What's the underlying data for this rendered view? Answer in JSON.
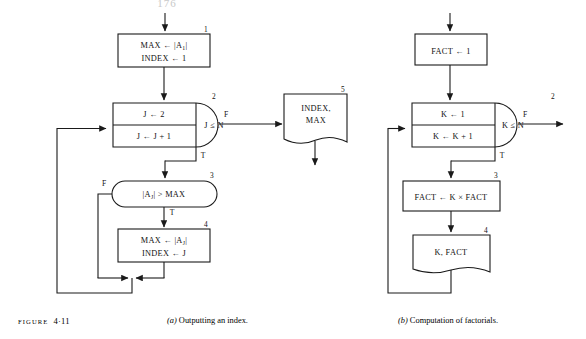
{
  "page": {
    "page_number": "176",
    "figure_label_prefix": "FIGURE",
    "figure_number": "4·11"
  },
  "captions": {
    "a_tag": "(a)",
    "a_text": "Outputting an index.",
    "b_tag": "(b)",
    "b_text": "Computation of factorials."
  },
  "colors": {
    "ink": "#1a1a1a",
    "paper": "#ffffff",
    "page_number": "#c9c9c9"
  },
  "diagram_a": {
    "title": "Outputting an index.",
    "nodes": [
      {
        "id": "a1",
        "type": "process",
        "number": "1",
        "lines": [
          "MAX ← |A₁|",
          "INDEX ← 1"
        ],
        "line1_main": "MAX",
        "line1_arrow": "←",
        "line1_val": "|A",
        "line1_sub": "1",
        "line1_tail": "|",
        "line2_main": "INDEX",
        "line2_arrow": "←",
        "line2_val": "1"
      },
      {
        "id": "a2",
        "type": "loop",
        "number": "2",
        "init": "J ← 2",
        "increment": "J ← J + 1",
        "condition": "J ≤ N",
        "false_label": "F",
        "true_label": "T"
      },
      {
        "id": "a3",
        "type": "decision",
        "number": "3",
        "condition_main": "|A",
        "condition_sub": "J",
        "condition_tail": "| > MAX",
        "condition_text": "|Aⱼ| > MAX",
        "false_label": "F",
        "true_label": "T"
      },
      {
        "id": "a4",
        "type": "process",
        "number": "4",
        "lines": [
          "MAX ← |Aⱼ|",
          "INDEX ← J"
        ],
        "line1_main": "MAX",
        "line1_arrow": "←",
        "line1_val": "|A",
        "line1_sub": "J",
        "line1_tail": "|",
        "line2_main": "INDEX",
        "line2_arrow": "←",
        "line2_val": "J"
      },
      {
        "id": "a5",
        "type": "output",
        "number": "5",
        "lines": [
          "INDEX,",
          "MAX"
        ],
        "line1": "INDEX,",
        "line2": "MAX"
      }
    ]
  },
  "diagram_b": {
    "title": "Computation of factorials.",
    "nodes": [
      {
        "id": "b1",
        "type": "process",
        "number": "",
        "line1_main": "FACT",
        "line1_arrow": "←",
        "line1_val": "1",
        "text": "FACT ← 1"
      },
      {
        "id": "b2",
        "type": "loop",
        "number": "2",
        "init": "K ← 1",
        "increment": "K ← K + 1",
        "condition": "K ≤ N",
        "false_label": "F",
        "true_label": "T"
      },
      {
        "id": "b3",
        "type": "process",
        "number": "3",
        "text": "FACT ← K × FACT"
      },
      {
        "id": "b4",
        "type": "output",
        "number": "4",
        "text": "K, FACT"
      }
    ]
  }
}
